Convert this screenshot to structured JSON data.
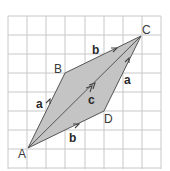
{
  "diagram": {
    "type": "vector-parallelogram-on-grid",
    "grid": {
      "cols": 8,
      "rows": 8,
      "origin_x": 8,
      "origin_y": 16,
      "cell": 19.1,
      "line_color": "#c8c8c8"
    },
    "fill_color": "#c4c4c4",
    "stroke_color": "#555555",
    "points": {
      "A": {
        "label": "A",
        "x": 28,
        "y": 148
      },
      "B": {
        "label": "B",
        "x": 65,
        "y": 73
      },
      "C": {
        "label": "C",
        "x": 141,
        "y": 36
      },
      "D": {
        "label": "D",
        "x": 104,
        "y": 111
      }
    },
    "vectors": {
      "a_left": {
        "label": "a",
        "from": "A",
        "to": "B"
      },
      "b_top": {
        "label": "b",
        "from": "B",
        "to": "C"
      },
      "a_right": {
        "label": "a",
        "from": "D",
        "to": "C"
      },
      "b_bottom": {
        "label": "b",
        "from": "A",
        "to": "D"
      },
      "c_diag": {
        "label": "c",
        "from": "A",
        "to": "C"
      }
    }
  }
}
